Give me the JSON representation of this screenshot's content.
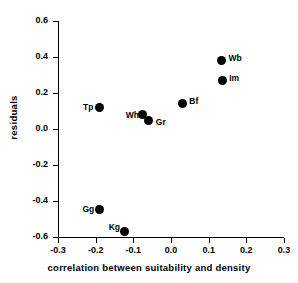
{
  "chart_data": {
    "type": "scatter",
    "title": "",
    "xlabel": "correlation between suitability and density",
    "ylabel": "residuals",
    "xlim": [
      -0.3,
      0.3
    ],
    "ylim": [
      -0.6,
      0.6
    ],
    "xticks": [
      "-0.3",
      "-0.2",
      "-0.1",
      "0.0",
      "0.1",
      "0.2",
      "0.3"
    ],
    "xtick_values": [
      -0.3,
      -0.2,
      -0.1,
      0.0,
      0.1,
      0.2,
      0.3
    ],
    "yticks": [
      "0.6",
      "0.4",
      "0.2",
      "0.0",
      "-0.2",
      "-0.4",
      "-0.6"
    ],
    "ytick_values": [
      0.6,
      0.4,
      0.2,
      0.0,
      -0.2,
      -0.4,
      -0.6
    ],
    "grid": false,
    "legend": "none",
    "marker_color": "#000000",
    "points": [
      {
        "label": "Tp",
        "x": -0.191,
        "y": 0.122,
        "label_dx": -16,
        "label_dy": -4
      },
      {
        "label": "Wh",
        "x": -0.075,
        "y": 0.079,
        "label_dx": -17,
        "label_dy": -4
      },
      {
        "label": "Gr",
        "x": -0.059,
        "y": 0.047,
        "label_dx": 7,
        "label_dy": -3
      },
      {
        "label": "Bf",
        "x": 0.03,
        "y": 0.139,
        "label_dx": 7,
        "label_dy": -7
      },
      {
        "label": "Wb",
        "x": 0.134,
        "y": 0.381,
        "label_dx": 7,
        "label_dy": -6
      },
      {
        "label": "Im",
        "x": 0.136,
        "y": 0.27,
        "label_dx": 7,
        "label_dy": -6
      },
      {
        "label": "Gg",
        "x": -0.19,
        "y": -0.447,
        "label_dx": -17,
        "label_dy": -4
      },
      {
        "label": "Kg",
        "x": -0.123,
        "y": -0.571,
        "label_dx": -16,
        "label_dy": -9
      }
    ]
  }
}
